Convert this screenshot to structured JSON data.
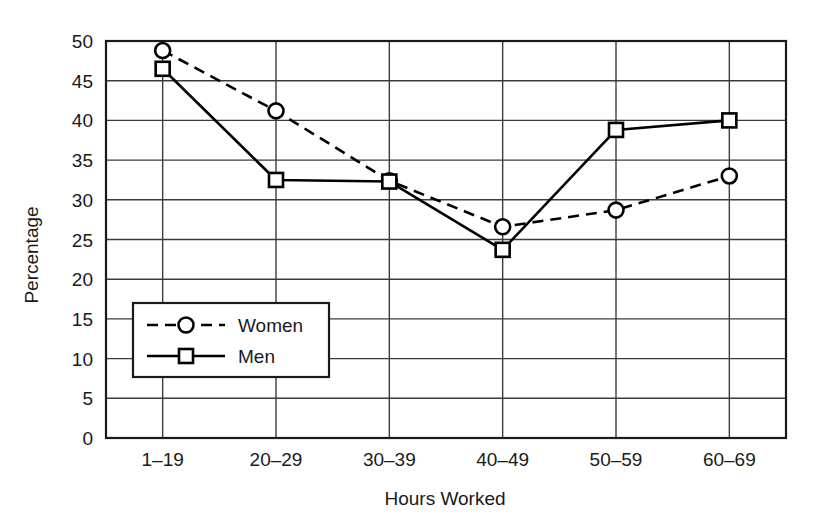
{
  "chart_data": {
    "type": "line",
    "title": "",
    "xlabel": "Hours Worked",
    "ylabel": "Percentage",
    "categories": [
      "1–19",
      "20–29",
      "30–39",
      "40–49",
      "50–59",
      "60–69"
    ],
    "ylim": [
      0,
      50
    ],
    "yticks": [
      0,
      5,
      10,
      15,
      20,
      25,
      30,
      35,
      40,
      45,
      50
    ],
    "ytick_labels": [
      "0",
      "5",
      "10",
      "15",
      "20",
      "25",
      "30",
      "35",
      "40",
      "45",
      "50"
    ],
    "grid": "both",
    "legend_position": "lower-left-inside",
    "series": [
      {
        "name": "Women",
        "values": [
          48.8,
          41.2,
          32.4,
          26.6,
          28.7,
          33.0
        ],
        "line_style": "dashed",
        "marker": "circle",
        "color": "#000000"
      },
      {
        "name": "Men",
        "values": [
          46.5,
          32.5,
          32.3,
          23.7,
          38.8,
          40.0
        ],
        "line_style": "solid",
        "marker": "square",
        "color": "#000000"
      }
    ]
  },
  "legend": {
    "entries": [
      {
        "label": "Women"
      },
      {
        "label": "Men"
      }
    ]
  },
  "colors": {
    "ink": "#1a1a1a",
    "grid": "#3c3c3c",
    "frame": "#1a1a1a",
    "background": "#ffffff"
  }
}
